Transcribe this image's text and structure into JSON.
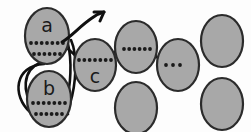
{
  "figure": {
    "width": 251,
    "height": 132,
    "background_color": "#fdfdfd"
  },
  "style": {
    "ellipse_fill": "#a8a8a8",
    "ellipse_stroke": "#2b2b2b",
    "ellipse_stroke_width": 2.2,
    "dot_color": "#1a1a1a",
    "dot_radius": 1.9,
    "label_color": "#1a1a1a",
    "label_font_size": 19,
    "curve_color": "#101010",
    "curve_width": 2.6,
    "arrow_color": "#101010",
    "arrow_width": 3.0
  },
  "nodes": [
    {
      "id": "a",
      "label": "a",
      "cx": 47,
      "cy": 36,
      "rx": 22,
      "ry": 28,
      "label_x": 47,
      "label_y": 25,
      "dot_rows": [
        {
          "y": 43,
          "x_start": 31,
          "x_end": 63,
          "count": 7
        },
        {
          "y": 54,
          "x_start": 34,
          "x_end": 60,
          "count": 6
        }
      ]
    },
    {
      "id": "b",
      "label": "b",
      "cx": 49,
      "cy": 99,
      "rx": 22,
      "ry": 28,
      "label_x": 49,
      "label_y": 88,
      "dot_rows": [
        {
          "y": 103,
          "x_start": 33,
          "x_end": 65,
          "count": 7
        },
        {
          "y": 114,
          "x_start": 36,
          "x_end": 62,
          "count": 6
        }
      ]
    },
    {
      "id": "c",
      "label": "c",
      "cx": 95,
      "cy": 65,
      "rx": 21,
      "ry": 26,
      "label_x": 95,
      "label_y": 76,
      "dot_rows": [
        {
          "y": 60,
          "x_start": 79,
          "x_end": 111,
          "count": 7
        }
      ]
    },
    {
      "id": "d",
      "label": "",
      "cx": 136,
      "cy": 47,
      "rx": 21,
      "ry": 26,
      "label_x": 136,
      "label_y": 47,
      "dot_rows": [
        {
          "y": 49,
          "x_start": 124,
          "x_end": 150,
          "count": 6
        }
      ]
    },
    {
      "id": "e",
      "label": "",
      "cx": 178,
      "cy": 65,
      "rx": 21,
      "ry": 26,
      "label_x": 178,
      "label_y": 65,
      "dot_rows": [
        {
          "y": 65,
          "x_start": 166,
          "x_end": 180,
          "count": 3
        }
      ]
    },
    {
      "id": "f",
      "label": "",
      "cx": 222,
      "cy": 41,
      "rx": 21,
      "ry": 26,
      "label_x": 222,
      "label_y": 41,
      "dot_rows": []
    },
    {
      "id": "g",
      "label": "",
      "cx": 136,
      "cy": 108,
      "rx": 21,
      "ry": 26,
      "label_x": 136,
      "label_y": 108,
      "dot_rows": []
    },
    {
      "id": "h",
      "label": "",
      "cx": 222,
      "cy": 104,
      "rx": 21,
      "ry": 26,
      "label_x": 222,
      "label_y": 104,
      "dot_rows": []
    }
  ],
  "connectors": [
    {
      "name": "link-c-to-d",
      "path": "M 112 54 L 120 48"
    },
    {
      "name": "link-d-to-e",
      "path": "M 152 53 L 165 64"
    },
    {
      "name": "link-a-to-c",
      "path": "M 68 49 L 76 56"
    },
    {
      "name": "loop-outer-left",
      "path": "M 44 64 C 14 66 12 96 30 112 C 38 119 52 122 62 118"
    },
    {
      "name": "loop-inner-left",
      "path": "M 40 63 C 22 70 22 94 34 106 C 44 116 58 119 68 114"
    },
    {
      "name": "loop-right-down",
      "path": "M 71 40 C 78 56 76 84 70 104 C 67 113 60 119 52 121"
    },
    {
      "name": "loop-right-inner",
      "path": "M 68 44 C 72 60 71 86 66 102 C 63 111 57 117 50 119"
    }
  ],
  "arrow": {
    "name": "outgoing-arrow",
    "path": "M 62 42 C 72 36 80 26 92 18 C 96 15 100 13 104 12",
    "head": "M 104 12 L 94 12 M 104 12 L 100 21"
  },
  "labels": {
    "a": "a",
    "b": "b",
    "c": "c"
  }
}
